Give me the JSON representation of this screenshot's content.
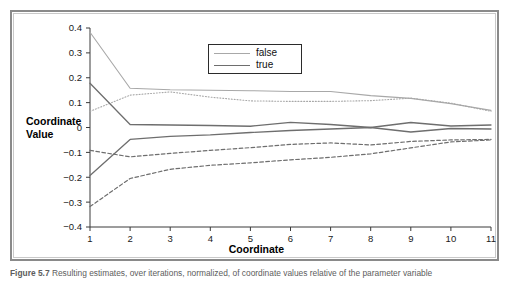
{
  "figure": {
    "caption_label": "Figure 5.7",
    "caption_text": "Resulting estimates, over iterations, normalized, of coordinate values relative of the parameter variable"
  },
  "chart_data": {
    "type": "line",
    "title": "",
    "xlabel": "Coordinate",
    "ylabel": "Coordinate Value",
    "x": [
      1,
      2,
      3,
      4,
      5,
      6,
      7,
      8,
      9,
      10,
      11
    ],
    "xlim": [
      1,
      11
    ],
    "ylim": [
      -0.4,
      0.4
    ],
    "xticks": [
      "1",
      "2",
      "3",
      "4",
      "5",
      "6",
      "7",
      "8",
      "9",
      "10",
      "11"
    ],
    "yticks": [
      "0.4",
      "0.3",
      "0.2",
      "0.1",
      "0",
      "−0.1",
      "−0.2",
      "−0.3",
      "−0.4"
    ],
    "ytick_values": [
      0.4,
      0.3,
      0.2,
      0.1,
      0,
      -0.1,
      -0.2,
      -0.3,
      -0.4
    ],
    "grid": false,
    "legend_position": "top-center",
    "legend": [
      {
        "label": "false",
        "color": "#a8a8a8",
        "style": "solid"
      },
      {
        "label": "true",
        "color": "#6e6e6e",
        "style": "solid"
      }
    ],
    "series": [
      {
        "name": "false-upper",
        "group": "false",
        "color": "#a8a8a8",
        "style": "solid",
        "width": 1.1,
        "values": [
          0.383,
          0.158,
          0.152,
          0.15,
          0.148,
          0.145,
          0.145,
          0.128,
          0.117,
          0.096,
          0.069
        ]
      },
      {
        "name": "false-lower",
        "group": "false",
        "color": "#a8a8a8",
        "style": "dotted",
        "width": 1.1,
        "values": [
          0.065,
          0.13,
          0.143,
          0.122,
          0.107,
          0.105,
          0.105,
          0.108,
          0.118,
          0.098,
          0.065
        ]
      },
      {
        "name": "true-upper",
        "group": "true",
        "color": "#6e6e6e",
        "style": "solid",
        "width": 1.3,
        "values": [
          0.178,
          0.012,
          0.01,
          0.008,
          0.005,
          0.021,
          0.012,
          0.0,
          0.02,
          0.006,
          0.01
        ]
      },
      {
        "name": "true-lower",
        "group": "true",
        "color": "#6e6e6e",
        "style": "solid",
        "width": 1.3,
        "values": [
          -0.193,
          -0.048,
          -0.036,
          -0.03,
          -0.02,
          -0.012,
          -0.006,
          0.0,
          -0.018,
          -0.004,
          -0.006
        ]
      },
      {
        "name": "true-dashed-a",
        "group": "true",
        "color": "#6e6e6e",
        "style": "dashed",
        "width": 1.2,
        "values": [
          -0.092,
          -0.118,
          -0.104,
          -0.092,
          -0.081,
          -0.068,
          -0.062,
          -0.07,
          -0.056,
          -0.05,
          -0.048
        ]
      },
      {
        "name": "true-dashed-b",
        "group": "true",
        "color": "#6e6e6e",
        "style": "dashed",
        "width": 1.2,
        "values": [
          -0.318,
          -0.205,
          -0.168,
          -0.152,
          -0.142,
          -0.13,
          -0.12,
          -0.106,
          -0.082,
          -0.058,
          -0.05
        ]
      }
    ]
  }
}
